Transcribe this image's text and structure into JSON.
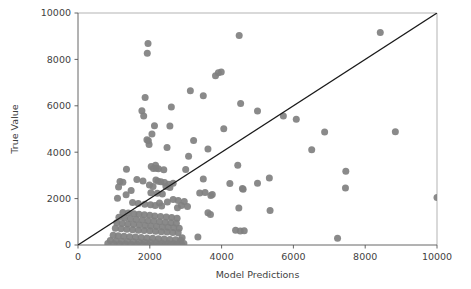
{
  "chart_data": {
    "type": "scatter",
    "title": "",
    "xlabel": "Model Predictions",
    "ylabel": "True Value",
    "xlim": [
      0,
      10000
    ],
    "ylim": [
      0,
      10000
    ],
    "grid": false,
    "legend": null,
    "xticks": [
      0,
      2000,
      4000,
      6000,
      8000,
      10000
    ],
    "yticks": [
      0,
      2000,
      4000,
      6000,
      8000,
      10000
    ],
    "xtick_labels": [
      "0",
      "2000",
      "4000",
      "6000",
      "8000",
      "10000"
    ],
    "ytick_labels": [
      "0",
      "2000",
      "4000",
      "6000",
      "8000",
      "10000"
    ],
    "marker_color": "#808080",
    "marker_size": 7,
    "annotations": [
      {
        "name": "identity-reference-line",
        "type": "line",
        "from": [
          0,
          0
        ],
        "to": [
          10000,
          10000
        ],
        "color": "#1a1a1a",
        "description": "1:1 diagonal reference line"
      }
    ],
    "series": [
      {
        "name": "predictions-vs-true",
        "color": "#808080",
        "points": [
          [
            1950,
            8680
          ],
          [
            1930,
            8270
          ],
          [
            4490,
            9030
          ],
          [
            8420,
            9160
          ],
          [
            3830,
            7300
          ],
          [
            3990,
            7460
          ],
          [
            3910,
            7420
          ],
          [
            3130,
            6650
          ],
          [
            3490,
            6430
          ],
          [
            1870,
            6360
          ],
          [
            4530,
            6100
          ],
          [
            5000,
            5780
          ],
          [
            1780,
            5790
          ],
          [
            1830,
            5560
          ],
          [
            5720,
            5560
          ],
          [
            6080,
            5420
          ],
          [
            2600,
            5950
          ],
          [
            2130,
            5140
          ],
          [
            2560,
            5130
          ],
          [
            2060,
            4780
          ],
          [
            4060,
            5010
          ],
          [
            6870,
            4870
          ],
          [
            8840,
            4880
          ],
          [
            2480,
            4200
          ],
          [
            3220,
            4500
          ],
          [
            3620,
            4140
          ],
          [
            6510,
            4110
          ],
          [
            1960,
            4490
          ],
          [
            1980,
            4330
          ],
          [
            1920,
            4540
          ],
          [
            3080,
            3830
          ],
          [
            4450,
            3440
          ],
          [
            7460,
            3180
          ],
          [
            2180,
            3310
          ],
          [
            2040,
            3380
          ],
          [
            2100,
            3300
          ],
          [
            2240,
            3290
          ],
          [
            1350,
            3260
          ],
          [
            2390,
            3240
          ],
          [
            3000,
            3250
          ],
          [
            2160,
            3440
          ],
          [
            7450,
            2460
          ],
          [
            5330,
            2890
          ],
          [
            5000,
            2660
          ],
          [
            4230,
            2650
          ],
          [
            3490,
            2840
          ],
          [
            4600,
            2400
          ],
          [
            4580,
            2430
          ],
          [
            1640,
            2820
          ],
          [
            1810,
            2760
          ],
          [
            1170,
            2740
          ],
          [
            1250,
            2710
          ],
          [
            2170,
            2800
          ],
          [
            2230,
            2750
          ],
          [
            2310,
            2730
          ],
          [
            2410,
            2690
          ],
          [
            2530,
            2620
          ],
          [
            2650,
            2660
          ],
          [
            1990,
            2590
          ],
          [
            2090,
            2520
          ],
          [
            2450,
            2520
          ],
          [
            2560,
            2480
          ],
          [
            1130,
            2500
          ],
          [
            1480,
            2350
          ],
          [
            3390,
            2240
          ],
          [
            3540,
            2260
          ],
          [
            3740,
            2180
          ],
          [
            3700,
            2130
          ],
          [
            2030,
            2250
          ],
          [
            2210,
            2230
          ],
          [
            2350,
            2200
          ],
          [
            1340,
            2170
          ],
          [
            1100,
            2010
          ],
          [
            2650,
            1960
          ],
          [
            2790,
            1920
          ],
          [
            2960,
            1880
          ],
          [
            2490,
            1850
          ],
          [
            2270,
            1810
          ],
          [
            1520,
            1830
          ],
          [
            1680,
            1790
          ],
          [
            1860,
            1760
          ],
          [
            2020,
            1740
          ],
          [
            2150,
            1700
          ],
          [
            2330,
            1680
          ],
          [
            2880,
            1700
          ],
          [
            3050,
            1660
          ],
          [
            2770,
            1610
          ],
          [
            4480,
            1590
          ],
          [
            5350,
            1490
          ],
          [
            3620,
            1390
          ],
          [
            3690,
            1320
          ],
          [
            1250,
            1400
          ],
          [
            1400,
            1380
          ],
          [
            1560,
            1350
          ],
          [
            1700,
            1330
          ],
          [
            1850,
            1300
          ],
          [
            2000,
            1280
          ],
          [
            2140,
            1250
          ],
          [
            2300,
            1230
          ],
          [
            2460,
            1210
          ],
          [
            2610,
            1180
          ],
          [
            2760,
            1150
          ],
          [
            1140,
            1200
          ],
          [
            1300,
            1160
          ],
          [
            1460,
            1130
          ],
          [
            1620,
            1100
          ],
          [
            1790,
            1080
          ],
          [
            1950,
            1050
          ],
          [
            2110,
            1030
          ],
          [
            2270,
            1000
          ],
          [
            2430,
            980
          ],
          [
            2590,
            960
          ],
          [
            2740,
            940
          ],
          [
            1080,
            960
          ],
          [
            1230,
            930
          ],
          [
            1390,
            900
          ],
          [
            1550,
            880
          ],
          [
            1710,
            860
          ],
          [
            1870,
            840
          ],
          [
            2030,
            820
          ],
          [
            2190,
            800
          ],
          [
            2350,
            780
          ],
          [
            2510,
            760
          ],
          [
            2670,
            740
          ],
          [
            2820,
            720
          ],
          [
            1040,
            720
          ],
          [
            1200,
            700
          ],
          [
            1360,
            680
          ],
          [
            1520,
            660
          ],
          [
            1680,
            640
          ],
          [
            1840,
            620
          ],
          [
            2000,
            610
          ],
          [
            2160,
            590
          ],
          [
            2320,
            570
          ],
          [
            2480,
            560
          ],
          [
            2640,
            540
          ],
          [
            2790,
            530
          ],
          [
            4390,
            640
          ],
          [
            4520,
            600
          ],
          [
            4630,
            610
          ],
          [
            7230,
            290
          ],
          [
            3340,
            350
          ],
          [
            2900,
            310
          ],
          [
            980,
            420
          ],
          [
            1120,
            400
          ],
          [
            1280,
            380
          ],
          [
            1440,
            360
          ],
          [
            1600,
            340
          ],
          [
            1760,
            320
          ],
          [
            1920,
            300
          ],
          [
            2080,
            290
          ],
          [
            2240,
            270
          ],
          [
            2400,
            260
          ],
          [
            2560,
            240
          ],
          [
            2720,
            230
          ],
          [
            2860,
            210
          ],
          [
            900,
            190
          ],
          [
            1060,
            170
          ],
          [
            1220,
            160
          ],
          [
            1380,
            150
          ],
          [
            1540,
            140
          ],
          [
            1700,
            130
          ],
          [
            1860,
            120
          ],
          [
            2020,
            110
          ],
          [
            2180,
            100
          ],
          [
            2340,
            90
          ],
          [
            2500,
            80
          ],
          [
            2660,
            70
          ],
          [
            2810,
            60
          ],
          [
            830,
            60
          ],
          [
            1000,
            50
          ],
          [
            1160,
            45
          ],
          [
            1320,
            40
          ],
          [
            1480,
            35
          ],
          [
            1640,
            30
          ],
          [
            1800,
            28
          ],
          [
            1960,
            25
          ],
          [
            2120,
            22
          ],
          [
            2280,
            20
          ],
          [
            2440,
            18
          ],
          [
            2600,
            15
          ],
          [
            2760,
            12
          ],
          [
            2890,
            20
          ],
          [
            2950,
            60
          ],
          [
            10000,
            2050
          ]
        ]
      }
    ]
  }
}
